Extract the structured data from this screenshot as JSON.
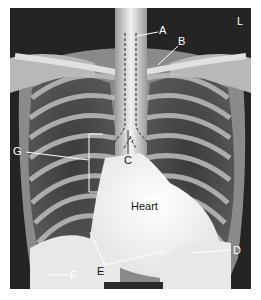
{
  "figure": {
    "orientation_marker": "L",
    "labels": {
      "A": "A",
      "B": "B",
      "C": "C",
      "D": "D",
      "E": "E",
      "F": "F",
      "G": "G",
      "heart": "Heart"
    },
    "colors": {
      "label_text": "#ffffff",
      "annotation_line": "#ffffff",
      "dark_lung": "#2b2b2b",
      "bone": "#e8e8e8",
      "background": "#1e1e1e",
      "scalebar": "#2a2a2a"
    }
  }
}
